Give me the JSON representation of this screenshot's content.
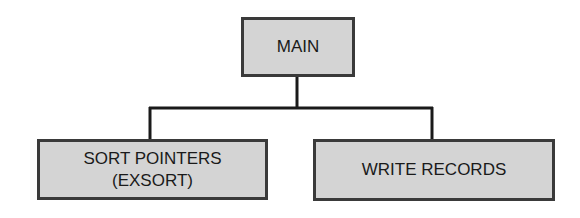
{
  "diagram": {
    "type": "hierarchy-chart",
    "root": {
      "label": "MAIN"
    },
    "children": [
      {
        "label_line1": "SORT POINTERS",
        "label_line2": "(EXSORT)"
      },
      {
        "label_line1": "WRITE RECORDS"
      }
    ],
    "colors": {
      "box_fill": "#d4d4d4",
      "box_border": "#3a3a3a",
      "connector": "#1a1a1a",
      "background": "#ffffff"
    }
  }
}
